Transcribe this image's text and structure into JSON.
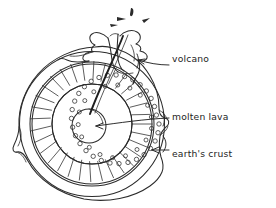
{
  "diagram": {
    "background_color": "#ffffff",
    "ink_color": "#2b2b2b",
    "style": "hand-drawn pen sketch",
    "labels": [
      {
        "id": "volcano",
        "text": "volcano",
        "x": 172,
        "y": 62,
        "points_to": "volcano-cone"
      },
      {
        "id": "molten-lava",
        "text": "molten lava",
        "x": 172,
        "y": 120,
        "points_to": "earth-core"
      },
      {
        "id": "earths-crust",
        "text": "earth's crust",
        "x": 172,
        "y": 157,
        "points_to": "crust-layer"
      }
    ],
    "layers": [
      {
        "id": "crust-layer",
        "name": "earth's crust",
        "kind": "outer-irregular-ring"
      },
      {
        "id": "dotted-band",
        "name": "speckled rock band",
        "kind": "ring-of-small-circles"
      },
      {
        "id": "hatched-mantle",
        "name": "hatched mantle",
        "kind": "radial-hatched-ring"
      },
      {
        "id": "inner-zone",
        "name": "inner zone",
        "kind": "plain-ring"
      },
      {
        "id": "earth-core",
        "name": "molten lava core",
        "kind": "small-circle"
      }
    ],
    "features": [
      {
        "id": "volcano-cone",
        "name": "volcano cone with erupting lava"
      },
      {
        "id": "lava-conduit",
        "name": "lava conduit from core to volcano"
      },
      {
        "id": "ejecta",
        "name": "erupting debris marks",
        "count": 4
      }
    ]
  }
}
